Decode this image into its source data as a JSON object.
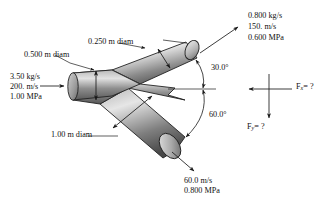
{
  "figure": {
    "type": "engineering-diagram",
    "background": "#ffffff",
    "ink": "#1a1a1a",
    "pipe_fill_light": "#d9d9d9",
    "pipe_fill_mid": "#9a9a9a",
    "pipe_fill_dark": "#4a4a4a",
    "pipe_outline": "#222222"
  },
  "dimensions": {
    "inlet_diam": "0.500 m diam",
    "upper_branch_diam": "0.250 m diam",
    "lower_branch_diam": "1.00 m diam"
  },
  "inlet": {
    "mass_flow": "3.50 kg/s",
    "velocity": "200. m/s",
    "pressure": "1.00 MPa"
  },
  "outlet_upper": {
    "mass_flow": "0.800 kg/s",
    "velocity": "150. m/s",
    "pressure": "0.600 MPa"
  },
  "outlet_lower": {
    "velocity": "60.0 m/s",
    "pressure": "0.800 MPa"
  },
  "angles": {
    "upper": "30.0°",
    "lower": "60.0°"
  },
  "forces": {
    "fx_symbol": "F",
    "fx_subscript": "x",
    "fx_value": "= ?",
    "fy_symbol": "F",
    "fy_subscript": "y",
    "fy_value": "= ?"
  },
  "icons": {
    "flow_arrow": "arrow-icon",
    "dimension_arrow": "double-headed-arrow-icon",
    "leader_line": "leader-line-icon",
    "angle_arc": "angle-arc-icon",
    "force_axis": "force-axis-icon"
  }
}
